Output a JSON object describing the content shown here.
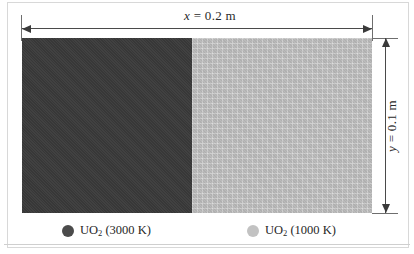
{
  "figure": {
    "title_x_label": "x = 0.2 m",
    "title_y_label": "y = 0.1 m",
    "dimension_x": {
      "variable": "x",
      "equals": " = ",
      "value": "0.2 m"
    },
    "dimension_y": {
      "variable": "y",
      "equals": " = ",
      "value": "0.1 m"
    }
  },
  "regions": {
    "hot": {
      "material": "UO",
      "subscript": "2",
      "temperature": "(3000 K)",
      "color": "#3a3a3a"
    },
    "cold": {
      "material": "UO",
      "subscript": "2",
      "temperature": "(1000 K)",
      "color": "#b8b8b8"
    }
  },
  "legend": {
    "items": [
      {
        "material": "UO",
        "subscript": "2",
        "temperature": "(3000 K)",
        "swatch_color": "#4b4b4b"
      },
      {
        "material": "UO",
        "subscript": "2",
        "temperature": "(1000 K)",
        "swatch_color": "#c2c2c2"
      }
    ]
  },
  "chart_data": {
    "type": "diagram",
    "domain_width_m": 0.2,
    "domain_height_m": 0.1,
    "regions": [
      {
        "name": "UO2 (3000 K)",
        "temperature_K": 3000,
        "x_range_m": [
          0.0,
          0.1
        ],
        "color": "#3a3a3a"
      },
      {
        "name": "UO2 (1000 K)",
        "temperature_K": 1000,
        "x_range_m": [
          0.1,
          0.2
        ],
        "color": "#b8b8b8"
      }
    ],
    "annotations": [
      "x = 0.2 m",
      "y = 0.1 m"
    ]
  }
}
